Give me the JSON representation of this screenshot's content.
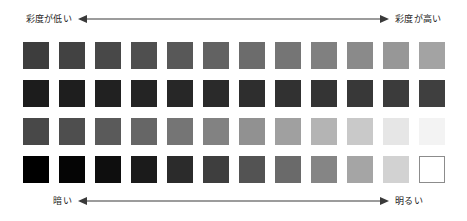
{
  "axes": {
    "top": {
      "left_label": "彩度が低い",
      "right_label": "彩度が高い",
      "arrow_left_icon": "arrow-left-icon",
      "arrow_right_icon": "arrow-right-icon"
    },
    "bottom": {
      "left_label": "暗い",
      "right_label": "明るい",
      "arrow_left_icon": "arrow-left-icon",
      "arrow_right_icon": "arrow-right-icon"
    }
  },
  "chart_data": {
    "type": "heatmap",
    "title": "",
    "xlabel": "彩度が低い ← → 彩度が高い",
    "ylabel": "暗い ← → 明るい",
    "grid": false,
    "legend": "none",
    "rows": 4,
    "columns": 12,
    "row_labels": [
      "row-1",
      "row-2",
      "row-3",
      "row-4"
    ],
    "column_labels": [
      "1",
      "2",
      "3",
      "4",
      "5",
      "6",
      "7",
      "8",
      "9",
      "10",
      "11",
      "12"
    ],
    "swatches": [
      [
        "#3d3d3d",
        "#424242",
        "#484848",
        "#4f4f4f",
        "#585858",
        "#626262",
        "#6c6c6c",
        "#757575",
        "#808080",
        "#8a8a8a",
        "#979797",
        "#a3a3a3"
      ],
      [
        "#1c1c1c",
        "#1e1e1e",
        "#212121",
        "#242424",
        "#272727",
        "#2a2a2a",
        "#2e2e2e",
        "#313131",
        "#343434",
        "#383838",
        "#3b3b3b",
        "#3f3f3f"
      ],
      [
        "#484848",
        "#4e4e4e",
        "#5a5a5a",
        "#666666",
        "#757575",
        "#828282",
        "#919191",
        "#a0a0a0",
        "#b4b4b4",
        "#c9c9c9",
        "#e6e6e6",
        "#f3f3f3"
      ],
      [
        "#000000",
        "#050505",
        "#0e0e0e",
        "#1b1b1b",
        "#2b2b2b",
        "#3e3e3e",
        "#535353",
        "#6a6a6a",
        "#858585",
        "#a5a5a5",
        "#d2d2d2",
        "#ffffff"
      ]
    ],
    "outlined_cells": [
      [
        3,
        11
      ]
    ],
    "outline_color": "#8c8c8c",
    "background": "#ffffff"
  }
}
